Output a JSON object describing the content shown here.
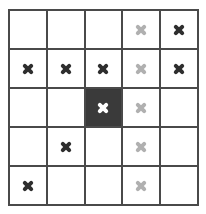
{
  "board": {
    "rows": 5,
    "cols": 5,
    "colors": {
      "grid_line": "#4a4a4a",
      "cell_bg": "#ffffff",
      "dark_cell_bg": "#3a3a3a",
      "mark_dark": "#2e2e2e",
      "mark_light": "#b0b0b0",
      "mark_on_dark": "#ffffff"
    },
    "cells": [
      [
        {
          "mark": "none"
        },
        {
          "mark": "none"
        },
        {
          "mark": "none"
        },
        {
          "mark": "light"
        },
        {
          "mark": "dark"
        }
      ],
      [
        {
          "mark": "dark"
        },
        {
          "mark": "dark"
        },
        {
          "mark": "dark"
        },
        {
          "mark": "light"
        },
        {
          "mark": "dark"
        }
      ],
      [
        {
          "mark": "none"
        },
        {
          "mark": "none"
        },
        {
          "mark": "white",
          "dark": true
        },
        {
          "mark": "light"
        },
        {
          "mark": "none"
        }
      ],
      [
        {
          "mark": "none"
        },
        {
          "mark": "dark"
        },
        {
          "mark": "none"
        },
        {
          "mark": "light"
        },
        {
          "mark": "none"
        }
      ],
      [
        {
          "mark": "dark"
        },
        {
          "mark": "none"
        },
        {
          "mark": "none"
        },
        {
          "mark": "light"
        },
        {
          "mark": "none"
        }
      ]
    ]
  }
}
